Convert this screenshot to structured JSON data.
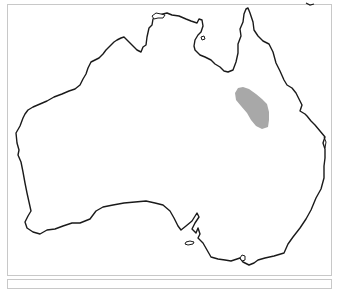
{
  "map": {
    "subject": "Australia",
    "colors": {
      "coastline": "#1a1a1a",
      "land": "#ffffff",
      "range_fill": "#a8a8a8",
      "frame_border": "#c8c8c8"
    },
    "highlighted_region": {
      "label": "",
      "location": "central Queensland"
    }
  }
}
